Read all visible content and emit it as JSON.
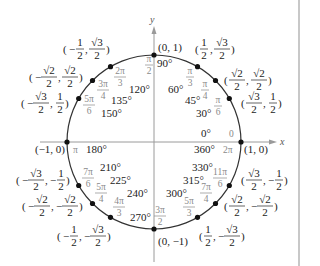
{
  "diagram": {
    "center": {
      "x": 154,
      "y": 142
    },
    "radius": 87,
    "colors": {
      "axis": "#9a9a9a",
      "circle": "#333333",
      "point": "#111111",
      "radian_text": "#8a8a8a",
      "text": "#222222",
      "border": "#c8c8c8"
    },
    "axes": {
      "x_label": "x",
      "y_label": "y"
    },
    "points": [
      {
        "deg": 0,
        "degree_label": "0°",
        "radian_label": "0",
        "coord": "(1, 0)"
      },
      {
        "deg": 30,
        "degree_label": "30°",
        "radian_label": "π/6",
        "coord": "(√3/2, 1/2)"
      },
      {
        "deg": 45,
        "degree_label": "45°",
        "radian_label": "π/4",
        "coord": "(√2/2, √2/2)"
      },
      {
        "deg": 60,
        "degree_label": "60°",
        "radian_label": "π/3",
        "coord": "(1/2, √3/2)"
      },
      {
        "deg": 90,
        "degree_label": "90°",
        "radian_label": "π/2",
        "coord": "(0, 1)"
      },
      {
        "deg": 120,
        "degree_label": "120°",
        "radian_label": "2π/3",
        "coord": "(−1/2, √3/2)"
      },
      {
        "deg": 135,
        "degree_label": "135°",
        "radian_label": "3π/4",
        "coord": "(−√2/2, √2/2)"
      },
      {
        "deg": 150,
        "degree_label": "150°",
        "radian_label": "5π/6",
        "coord": "(−√3/2, 1/2)"
      },
      {
        "deg": 180,
        "degree_label": "180°",
        "radian_label": "π",
        "coord": "(−1, 0)"
      },
      {
        "deg": 210,
        "degree_label": "210°",
        "radian_label": "7π/6",
        "coord": "(−√3/2, −1/2)"
      },
      {
        "deg": 225,
        "degree_label": "225°",
        "radian_label": "5π/4",
        "coord": "(−√2/2, −√2/2)"
      },
      {
        "deg": 240,
        "degree_label": "240°",
        "radian_label": "4π/3",
        "coord": "(−1/2, −√3/2)"
      },
      {
        "deg": 270,
        "degree_label": "270°",
        "radian_label": "3π/2",
        "coord": "(0, −1)"
      },
      {
        "deg": 300,
        "degree_label": "300°",
        "radian_label": "5π/3",
        "coord": "(1/2, −√3/2)"
      },
      {
        "deg": 315,
        "degree_label": "315°",
        "radian_label": "7π/4",
        "coord": "(√2/2, −√2/2)"
      },
      {
        "deg": 330,
        "degree_label": "330°",
        "radian_label": "11π/6",
        "coord": "(√3/2, −1/2)"
      },
      {
        "deg": 360,
        "degree_label": "360°",
        "radian_label": "2π",
        "coord": "(1, 0)"
      }
    ]
  }
}
